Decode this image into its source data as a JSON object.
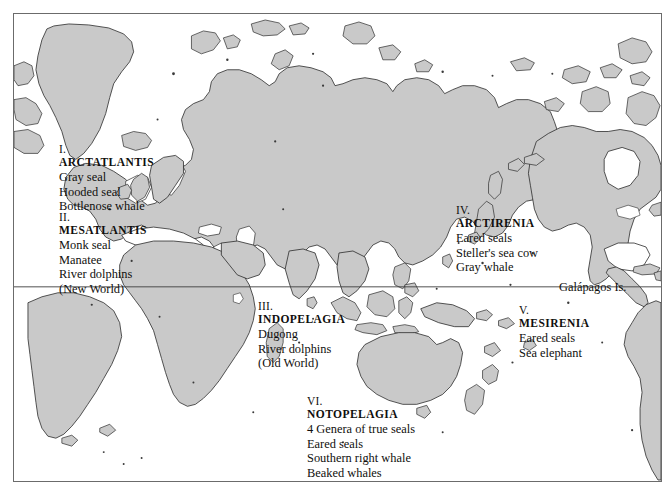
{
  "map": {
    "title": "Marine Mammal Biogeographic Regions",
    "projection": "world-equirectangular-pacific-right",
    "land_color": "#c9c9c9",
    "coastline_color": "#2b2b2b",
    "ocean_color": "#ffffff",
    "frame_color": "#6b6b6b",
    "equator_label": "",
    "equator_visible": true
  },
  "regions": [
    {
      "numeral": "I.",
      "name": "ARCTATLANTIS",
      "taxa": [
        "Gray seal",
        "Hooded seal",
        "Bottlenose whale"
      ],
      "x": 58,
      "y": 142
    },
    {
      "numeral": "II.",
      "name": "MESATLANTIS",
      "taxa": [
        "Monk seal",
        "Manatee",
        "River dolphins",
        "(New World)"
      ],
      "x": 58,
      "y": 210
    },
    {
      "numeral": "III.",
      "name": "INDOPELAGIA",
      "taxa": [
        "Dugong",
        "River dolphins",
        "(Old World)"
      ],
      "x": 257,
      "y": 299
    },
    {
      "numeral": "IV.",
      "name": "ARCTIRENIA",
      "taxa": [
        "Eared seals",
        "Steller's sea cow",
        "Gray whale"
      ],
      "x": 455,
      "y": 203
    },
    {
      "numeral": "V.",
      "name": "MESIRENIA",
      "taxa": [
        "Eared seals",
        "Sea elephant"
      ],
      "x": 518,
      "y": 303
    },
    {
      "numeral": "VI.",
      "name": "NOTOPELAGIA",
      "taxa": [
        "4 Genera of true seals",
        "Eared seals",
        "Southern right whale",
        "Beaked whales"
      ],
      "x": 306,
      "y": 394
    }
  ],
  "places": [
    {
      "label": "Galápagos Is.",
      "x": 560,
      "y": 287
    }
  ]
}
